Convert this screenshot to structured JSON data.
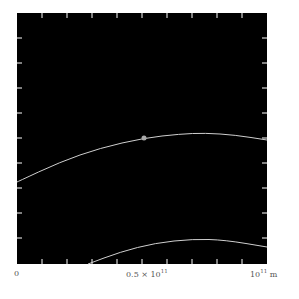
{
  "chart_data": {
    "type": "line",
    "title": "",
    "xlabel": "m",
    "ylabel": "",
    "x_ticks": [
      "0",
      "0.5 × 10^11",
      "10^11 m"
    ],
    "xlim": [
      0,
      100000000000.0
    ],
    "background": "#000000",
    "curve_color": "#cfcfcf",
    "series": [
      {
        "name": "upper-trajectory",
        "points_px": [
          [
            17,
            182
          ],
          [
            60,
            162
          ],
          [
            100,
            148
          ],
          [
            144,
            138
          ],
          [
            180,
            134
          ],
          [
            205,
            133
          ],
          [
            235,
            135
          ],
          [
            267,
            140
          ]
        ]
      },
      {
        "name": "lower-trajectory",
        "points_px": [
          [
            88,
            264
          ],
          [
            120,
            252
          ],
          [
            155,
            243
          ],
          [
            193,
            239
          ],
          [
            225,
            240
          ],
          [
            267,
            247
          ]
        ]
      }
    ],
    "marker": {
      "x_px": 144,
      "y_px": 138,
      "color": "#aaaaaa"
    }
  },
  "labels": {
    "x0": "0",
    "xmid_base": "0.5 × 10",
    "xmid_exp": "11",
    "xmax_base": "10",
    "xmax_exp": "11",
    "xmax_unit": " m"
  }
}
